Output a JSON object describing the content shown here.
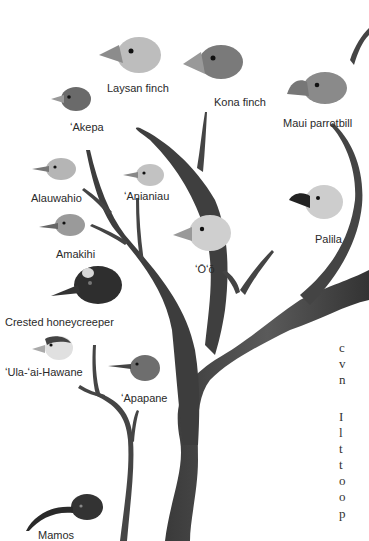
{
  "figure": {
    "birds": [
      {
        "id": "laysan-finch",
        "label": "Laysan finch"
      },
      {
        "id": "kona-finch",
        "label": "Kona finch"
      },
      {
        "id": "akepa",
        "label": "ʻAkepa"
      },
      {
        "id": "maui-parrotbill",
        "label": "Maui parrotbill"
      },
      {
        "id": "alauwahio",
        "label": "Alauwahio"
      },
      {
        "id": "anianiau",
        "label": "ʻAnianiau"
      },
      {
        "id": "amakihi",
        "label": "Amakihi"
      },
      {
        "id": "oo",
        "label": "ʻŌʻō"
      },
      {
        "id": "palila",
        "label": "Palila"
      },
      {
        "id": "crested-honeycreeper",
        "label": "Crested honeycreeper"
      },
      {
        "id": "ula-ai-hawane",
        "label": "ʻUla-ʻai-Hawane"
      },
      {
        "id": "apapane",
        "label": "ʻApapane"
      },
      {
        "id": "mamos",
        "label": "Mamos"
      }
    ]
  },
  "body_text": {
    "lines": [
      "c",
      "v",
      "n",
      "",
      "I",
      "l",
      "t",
      "t",
      "o",
      "o",
      "p"
    ]
  },
  "colors": {
    "branch": "#4a4a4a",
    "branch_dark": "#333333",
    "label": "#2a2a2a",
    "background": "#ffffff"
  }
}
